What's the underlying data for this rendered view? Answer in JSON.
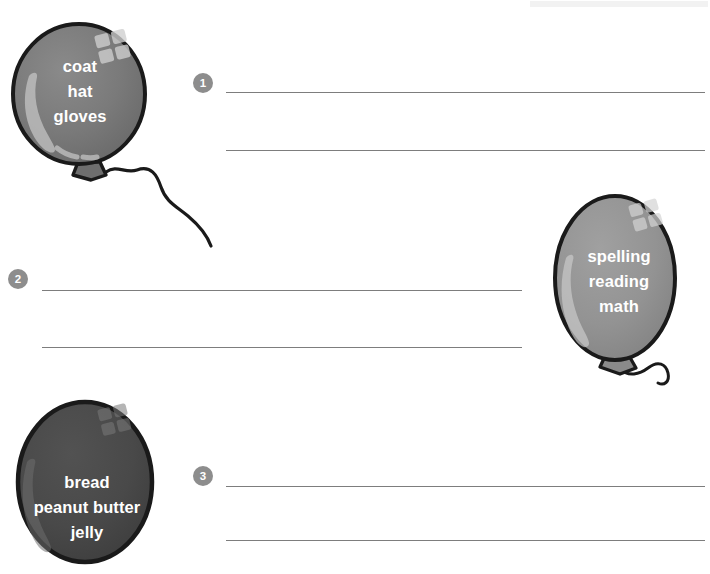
{
  "worksheet": {
    "title": "Balloon word-group writing worksheet",
    "background_color": "#ffffff",
    "line_color": "#7d7d7d",
    "badge_color": "#8d8d8d",
    "balloon_outline_color": "#1a1a1a"
  },
  "balloons": [
    {
      "id": "balloon-1",
      "number": "1",
      "fill_color": "#787878",
      "words": [
        "coat",
        "hat",
        "gloves"
      ],
      "word_lines": "coat\nhat\ngloves",
      "has_string": true,
      "shape": "round"
    },
    {
      "id": "balloon-2",
      "number": "2",
      "fill_color": "#949494",
      "words": [
        "spelling",
        "reading",
        "math"
      ],
      "word_lines": "spelling\nreading\nmath",
      "has_string": true,
      "shape": "oval"
    },
    {
      "id": "balloon-3",
      "number": "3",
      "fill_color": "#484848",
      "words": [
        "bread",
        "peanut butter",
        "jelly"
      ],
      "word_lines": "bread\npeanut butter\njelly",
      "has_string": false,
      "shape": "oval"
    }
  ],
  "answer_rows": [
    {
      "number": "1",
      "line_count": 2,
      "answer_line_1": "",
      "answer_line_2": ""
    },
    {
      "number": "2",
      "line_count": 2,
      "answer_line_1": "",
      "answer_line_2": ""
    },
    {
      "number": "3",
      "line_count": 2,
      "answer_line_1": "",
      "answer_line_2": ""
    }
  ]
}
